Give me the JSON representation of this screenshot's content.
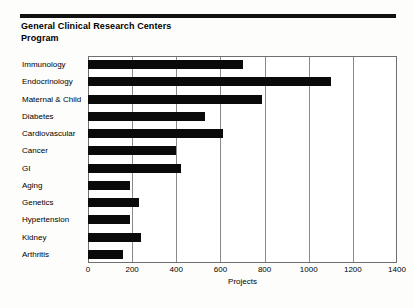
{
  "header": {
    "title_line1": "General Clinical Research Centers",
    "title_line2": "Program"
  },
  "chart_data": {
    "type": "bar",
    "orientation": "horizontal",
    "title": "General Clinical Research Centers Program",
    "xlabel": "Projects",
    "ylabel": "",
    "xlim": [
      0,
      1400
    ],
    "xticks": [
      0,
      200,
      400,
      600,
      800,
      1000,
      1200,
      1400
    ],
    "grid": "vertical",
    "legend": "none",
    "bar_color": "#0a0a0a",
    "categories": [
      "Immunology",
      "Endocrinology",
      "Maternal & Child",
      "Diabetes",
      "Cardiovascular",
      "Cancer",
      "GI",
      "Aging",
      "Genetics",
      "Hypertension",
      "Kidney",
      "Arthritis"
    ],
    "values": [
      700,
      1100,
      790,
      530,
      610,
      400,
      420,
      190,
      230,
      190,
      240,
      160
    ]
  }
}
